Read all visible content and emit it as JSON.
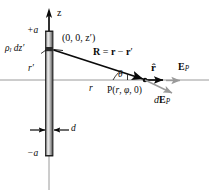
{
  "figure": {
    "type": "physics-vector-diagram",
    "colors": {
      "ink": "#0a0a0a",
      "axis": "#8a8a8a",
      "rod_light": "#efefef",
      "rod_mid": "#b9b9b9",
      "rod_dark": "#4a4a4a",
      "gray_arrow": "#9a9a9a",
      "background": "#ffffff"
    },
    "axes": {
      "z_label": "z",
      "vertical_axis_x": 49,
      "horizontal_axis_y": 80
    },
    "rod": {
      "top_label": "+a",
      "bottom_label": "−a",
      "width_label": "d",
      "x": 46,
      "top_y": 31,
      "bottom_y": 156
    },
    "labels": {
      "charge_element": {
        "rho": "ρ",
        "rho_sub": "l",
        "dz": " dz",
        "prime": "′"
      },
      "source_point": "(0, 0, z′)",
      "r_prime": "r′",
      "r": "r",
      "theta": "θ",
      "R_vector": {
        "R": "R",
        "eq": " = ",
        "r": "r",
        "minus": " − ",
        "rp": "r",
        "prime": "′"
      },
      "field_point": {
        "P": "P(",
        "r": "r",
        "comma1": ", ",
        "phi": "φ",
        "comma2": ", 0)"
      },
      "r_hat": "r̂",
      "E_P": {
        "E": "E",
        "sub": "P"
      },
      "dE_P": {
        "d": "d",
        "E": "E",
        "sub": "P"
      }
    }
  }
}
